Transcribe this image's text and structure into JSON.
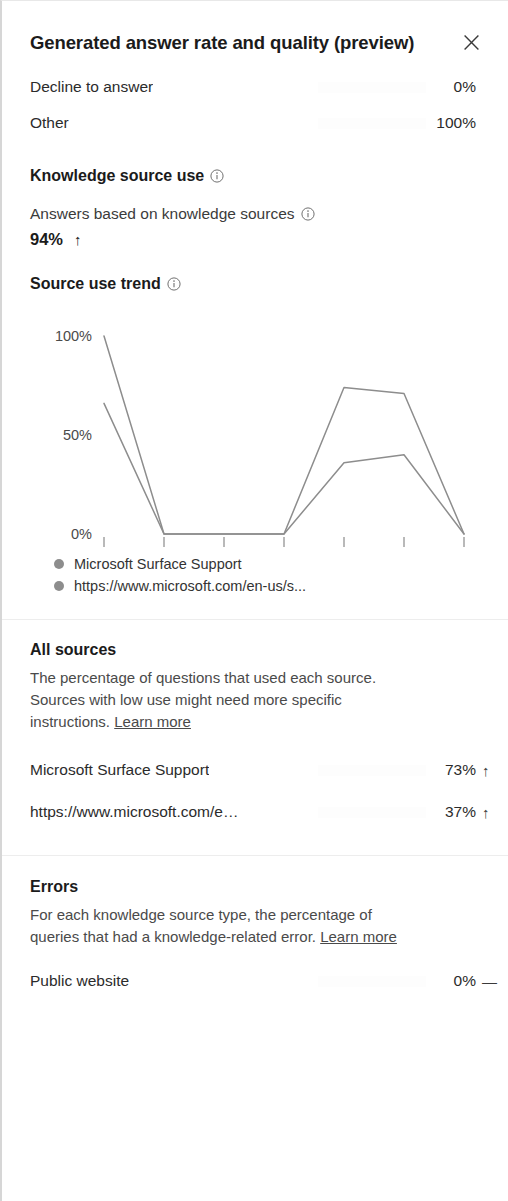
{
  "header": {
    "title": "Generated answer rate and quality (preview)",
    "close_label": "Close"
  },
  "answer_quality": {
    "rows": [
      {
        "label": "Decline to answer",
        "value": "0%",
        "pct": 0
      },
      {
        "label": "Other",
        "value": "100%",
        "pct": 100
      }
    ]
  },
  "knowledge_source_use": {
    "heading": "Knowledge source use",
    "stat_label": "Answers based on knowledge sources",
    "stat_value": "94%",
    "stat_trend": "↑"
  },
  "source_use_trend": {
    "heading": "Source use trend",
    "legend": [
      {
        "label": "Microsoft Surface Support",
        "color": "#8d8d8d"
      },
      {
        "label": "https://www.microsoft.com/en-us/s...",
        "color": "#8d8d8d"
      }
    ]
  },
  "chart_data": {
    "type": "line",
    "title": "Source use trend",
    "xlabel": "",
    "ylabel": "",
    "ylim": [
      0,
      100
    ],
    "yticks": [
      0,
      50,
      100
    ],
    "ytick_labels": [
      "0%",
      "50%",
      "100%"
    ],
    "grid": false,
    "legend_position": "bottom-left",
    "categories": [
      "Aug 10",
      "Aug 11",
      "Aug 12",
      "Aug 13",
      "Aug 14",
      "Aug 15",
      "Au..."
    ],
    "series": [
      {
        "name": "Microsoft Surface Support",
        "color": "#8d8d8d",
        "values": [
          100,
          0,
          0,
          0,
          74,
          71,
          0
        ]
      },
      {
        "name": "https://www.microsoft.com/en-us/s...",
        "color": "#8d8d8d",
        "values": [
          66,
          0,
          0,
          0,
          36,
          40,
          0
        ]
      }
    ]
  },
  "all_sources": {
    "heading": "All sources",
    "description_1": "The percentage of questions that used each source.",
    "description_2": "Sources with low use might need more specific",
    "description_3": "instructions.",
    "learn_more": "Learn more",
    "rows": [
      {
        "label": "Microsoft Surface Support",
        "value": "73%",
        "pct": 67,
        "trend": "↑"
      },
      {
        "label": "https://www.microsoft.com/en...",
        "value": "37%",
        "pct": 45,
        "trend": "↑"
      }
    ]
  },
  "errors": {
    "heading": "Errors",
    "description_1": "For each knowledge source type, the percentage of",
    "description_2": "queries that had a knowledge-related error.",
    "learn_more": "Learn more",
    "rows": [
      {
        "label": "Public website",
        "value": "0%",
        "pct": 0,
        "trend": "—"
      }
    ]
  }
}
